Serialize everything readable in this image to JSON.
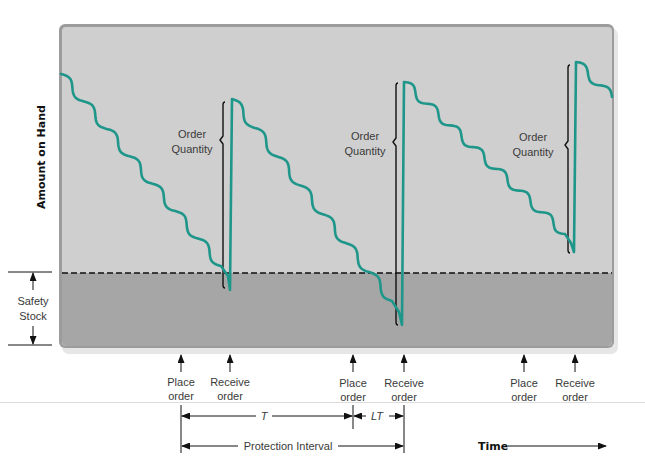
{
  "figure": {
    "y_axis_label": "Amount on Hand",
    "x_axis_label": "Time",
    "safety_stock": {
      "line1": "Safety",
      "line2": "Stock"
    },
    "order_quantity": [
      {
        "line1": "Order",
        "line2": "Quantity"
      },
      {
        "line1": "Order",
        "line2": "Quantity"
      },
      {
        "line1": "Order",
        "line2": "Quantity"
      }
    ],
    "events": [
      {
        "line1": "Place",
        "line2": "order"
      },
      {
        "line1": "Receive",
        "line2": "order"
      },
      {
        "line1": "Place",
        "line2": "order"
      },
      {
        "line1": "Receive",
        "line2": "order"
      },
      {
        "line1": "Place",
        "line2": "order"
      },
      {
        "line1": "Receive",
        "line2": "order"
      }
    ],
    "intervals": {
      "review_period": "T",
      "lead_time": "LT",
      "protection": "Protection Interval"
    }
  },
  "colors": {
    "inventory_line": "#1f968a",
    "plot_background": "#cfcfcf",
    "safety_zone": "#a6a6a6",
    "frame": "#9c9c9c",
    "annotation": "#111111"
  },
  "chart_data": {
    "type": "line",
    "title": "",
    "xlabel": "Time",
    "ylabel": "Amount on Hand",
    "annotations": [
      "Order Quantity",
      "Order Quantity",
      "Order Quantity",
      "Safety Stock",
      "T",
      "LT",
      "Protection Interval"
    ],
    "events_x": {
      "place_order": [
        181,
        353,
        524
      ],
      "receive_order": [
        230,
        403,
        575
      ]
    },
    "safety_stock_level_y": 273,
    "cycles": [
      {
        "from": [
          61,
          74
        ],
        "to": [
          221,
          266
        ],
        "waves": 7,
        "amp": 4,
        "tail": [
          [
            228,
            276
          ],
          [
            230,
            290
          ],
          [
            232,
            99
          ]
        ]
      },
      {
        "from": [
          232,
          99
        ],
        "to": [
          392,
          301
        ],
        "waves": 7,
        "amp": 4,
        "tail": [
          [
            399,
            312
          ],
          [
            402,
            325
          ],
          [
            404,
            82
          ]
        ]
      },
      {
        "from": [
          404,
          82
        ],
        "to": [
          565,
          234
        ],
        "waves": 7,
        "amp": 4,
        "tail": [
          [
            571,
            243
          ],
          [
            574,
            252
          ],
          [
            576,
            62
          ]
        ]
      },
      {
        "from": [
          576,
          62
        ],
        "to": [
          612,
          97
        ],
        "waves": 1.5,
        "amp": 4,
        "tail": []
      }
    ],
    "order_quantity_brackets": [
      {
        "x": 223,
        "top": 102,
        "bottom": 288,
        "tip": 140
      },
      {
        "x": 396,
        "top": 83,
        "bottom": 325,
        "tip": 142
      },
      {
        "x": 568,
        "top": 65,
        "bottom": 253,
        "tip": 145
      }
    ]
  }
}
